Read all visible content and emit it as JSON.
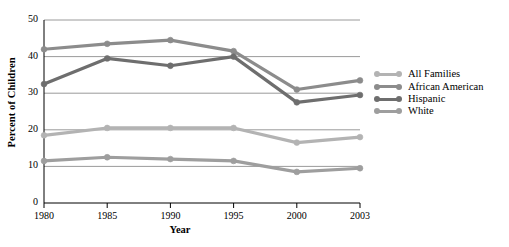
{
  "chart_data": {
    "type": "line",
    "title": "",
    "xlabel": "Year",
    "ylabel": "Percent of Children",
    "categories": [
      "1980",
      "1985",
      "1990",
      "1995",
      "2000",
      "2003"
    ],
    "x": [
      1980,
      1985,
      1990,
      1995,
      2000,
      2003
    ],
    "xlim": [
      1980,
      2003
    ],
    "ylim": [
      0,
      50
    ],
    "yticks": [
      0,
      10,
      20,
      30,
      40,
      50
    ],
    "ytick_labels": [
      "0",
      "10",
      "20",
      "30",
      "40",
      "50"
    ],
    "xtick_labels": [
      "1980",
      "1985",
      "1990",
      "1995",
      "2000",
      "2003"
    ],
    "grid": "horizontal",
    "legend_position": "right",
    "series": [
      {
        "name": "All Families",
        "color": "#b3b3b3",
        "values": [
          18.5,
          20.5,
          20.5,
          20.5,
          16.5,
          18.0
        ]
      },
      {
        "name": "African American",
        "color": "#8c8c8c",
        "values": [
          42.0,
          43.5,
          44.5,
          41.5,
          31.0,
          33.5
        ]
      },
      {
        "name": "Hispanic",
        "color": "#6e6e6e",
        "values": [
          32.5,
          39.5,
          37.5,
          40.0,
          27.5,
          29.5
        ]
      },
      {
        "name": "White",
        "color": "#9e9e9e",
        "values": [
          11.5,
          12.5,
          12.0,
          11.5,
          8.5,
          9.5
        ]
      }
    ]
  },
  "axes": {
    "axis_color": "#000000",
    "grid_color": "#808080"
  },
  "legend": {
    "items": [
      {
        "label": "All Families"
      },
      {
        "label": "African American"
      },
      {
        "label": "Hispanic"
      },
      {
        "label": "White"
      }
    ]
  }
}
